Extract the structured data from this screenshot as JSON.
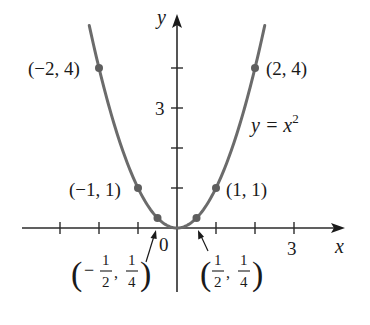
{
  "chart_data": {
    "type": "line",
    "title": "",
    "function_label": "y = x²",
    "function_label_base": "y = x",
    "function_label_exp": "2",
    "xlabel": "x",
    "ylabel": "y",
    "xlim": [
      -4,
      4.2
    ],
    "ylim": [
      -1.6,
      5.3
    ],
    "grid": false,
    "origin_label": "0",
    "x_tick_values": [
      -3,
      -2,
      -1,
      1,
      2,
      3
    ],
    "x_tick_labels": [
      {
        "value": 3,
        "label": "3"
      }
    ],
    "y_tick_values": [
      1,
      2,
      3,
      4
    ],
    "y_tick_labels": [
      {
        "value": 3,
        "label": "3"
      }
    ],
    "series": [
      {
        "name": "y = x^2",
        "x": [
          -2.25,
          -2,
          -1.5,
          -1,
          -0.5,
          0,
          0.5,
          1,
          1.5,
          2,
          2.25
        ],
        "y": [
          5.0625,
          4,
          2.25,
          1,
          0.25,
          0,
          0.25,
          1,
          2.25,
          4,
          5.0625
        ],
        "color": "#6b6b6b"
      }
    ],
    "marked_points": [
      {
        "x": -2,
        "y": 4,
        "label": "(−2, 4)"
      },
      {
        "x": 2,
        "y": 4,
        "label": "(2, 4)"
      },
      {
        "x": -1,
        "y": 1,
        "label": "(−1, 1)"
      },
      {
        "x": 1,
        "y": 1,
        "label": "(1, 1)"
      },
      {
        "x": -0.5,
        "y": 0.25,
        "label": "(−½, ¼)",
        "num1": "1",
        "den1": "2",
        "num2": "1",
        "den2": "4",
        "sign": "−"
      },
      {
        "x": 0.5,
        "y": 0.25,
        "label": "(½, ¼)",
        "num1": "1",
        "den1": "2",
        "num2": "1",
        "den2": "4",
        "sign": ""
      }
    ]
  },
  "colors": {
    "curve": "#6b6b6b",
    "axis": "#2b2b2b",
    "point": "#5e5e5e",
    "text": "#1a1a1a"
  }
}
